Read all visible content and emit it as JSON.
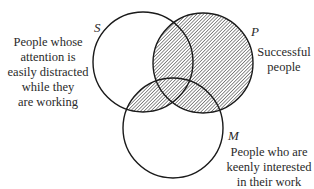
{
  "diagram": {
    "type": "venn",
    "sets": [
      {
        "id": "S",
        "name": "S",
        "description": [
          "People whose",
          "attention is",
          "easily distracted",
          "while they",
          "are working"
        ]
      },
      {
        "id": "P",
        "name": "P",
        "description": [
          "Successful",
          "people"
        ]
      },
      {
        "id": "M",
        "name": "M",
        "description": [
          "People who are",
          "keenly interested",
          "in their work"
        ]
      }
    ],
    "shaded_regions": "P ∪ (S ∩ M)",
    "colors": {
      "stroke": "#1a1a1a",
      "hatch": "#555555",
      "background": "#ffffff"
    }
  }
}
